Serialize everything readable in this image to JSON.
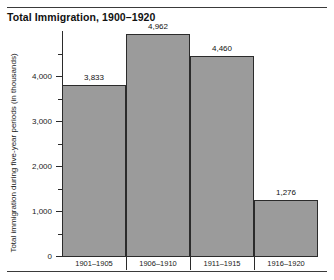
{
  "chart_data": {
    "type": "bar",
    "title": "Total Immigration, 1900–1920",
    "xlabel": "",
    "ylabel": "Total immigration during five-year periods (in thousands)",
    "categories": [
      "1901–1905",
      "1906–1910",
      "1911–1915",
      "1916–1920"
    ],
    "values": [
      3833,
      4962,
      4460,
      1276
    ],
    "value_labels": [
      "3,833",
      "4,962",
      "4,460",
      "1,276"
    ],
    "ylim": [
      0,
      5200
    ],
    "ytick_values": [
      0,
      1000,
      2000,
      3000,
      4000
    ],
    "ytick_labels": [
      "0",
      "1,000",
      "2,000",
      "3,000",
      "4,000"
    ],
    "yminor_values": [
      500,
      1500,
      2500,
      3500,
      4500
    ],
    "grid": false,
    "legend": null,
    "bar_color": "#9b9b9b",
    "bar_edge_color": "#2b2b2b",
    "axis_color": "#2b2b2b",
    "rule_color": "#3a3a3a",
    "background": "#ffffff"
  }
}
